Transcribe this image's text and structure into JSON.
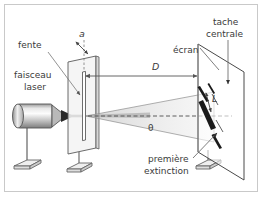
{
  "figure": {
    "title_visible": false,
    "background_color": "#ffffff",
    "frame_color": "#c9c9c9",
    "text_color": "#3a3a3a",
    "line_color": "#555555",
    "fringe_color": "#1a1a1a"
  },
  "labels": {
    "fente": "fente",
    "faisceau_laser_line1": "faisceau",
    "faisceau_laser_line2": "laser",
    "slit_width": "a",
    "distance": "D",
    "ecran": "écran",
    "tache_centrale_line1": "tache",
    "tache_centrale_line2": "centrale",
    "spot_length": "L",
    "angle": "θ",
    "premiere_extinction_line1": "première",
    "premiere_extinction_line2": "extinction"
  },
  "components": {
    "laser_source": "laser-cylinder",
    "slit_plate": "slit-plate",
    "screen_plate": "screen-plate",
    "stand_laser": "laser-stand",
    "stand_slit": "slit-stand",
    "stand_screen": "screen-stand",
    "beam": "laser-beam",
    "diffraction_cone": "diffraction-cone",
    "optical_axis": "optical-axis-dashed",
    "fringes_count": 4
  }
}
